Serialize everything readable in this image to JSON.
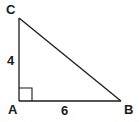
{
  "diagram": {
    "type": "right-triangle",
    "colors": {
      "stroke": "#1a1a1a",
      "background": "#ffffff"
    },
    "vertices": {
      "A": {
        "label": "A",
        "x": 19,
        "y": 101
      },
      "B": {
        "label": "B",
        "x": 121,
        "y": 101
      },
      "C": {
        "label": "C",
        "x": 19,
        "y": 18
      }
    },
    "sides": {
      "AC": {
        "label": "4"
      },
      "AB": {
        "label": "6"
      }
    },
    "right_angle_at": "A"
  }
}
